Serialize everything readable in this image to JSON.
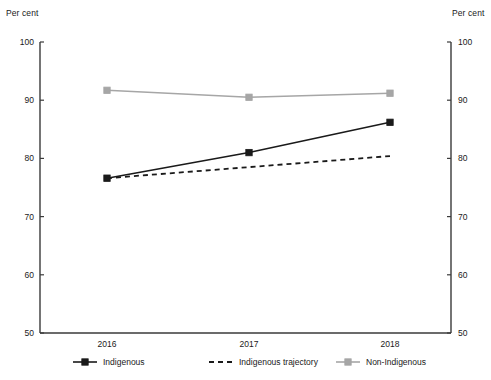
{
  "axis_caption_left": "Per cent",
  "axis_caption_right": "Per cent",
  "legend": {
    "items": [
      {
        "label": "Indigenous",
        "style": "solid-square",
        "color": "#1a1a1a"
      },
      {
        "label": "Indigenous trajectory",
        "style": "dashed",
        "color": "#1a1a1a"
      },
      {
        "label": "Non-Indigenous",
        "style": "solid-square",
        "color": "#a6a6a6"
      }
    ]
  },
  "colors": {
    "indigenous": "#1a1a1a",
    "indigenous_trajectory": "#1a1a1a",
    "non_indigenous": "#a6a6a6",
    "axis": "#3a3a3a",
    "text": "#1a1a1a"
  },
  "chart_data": {
    "type": "line",
    "title": "",
    "xlabel": "",
    "ylabel": "Per cent",
    "categories": [
      "2016",
      "2017",
      "2018"
    ],
    "x": [
      2016,
      2017,
      2018
    ],
    "ylim": [
      50,
      100
    ],
    "yticks": [
      50,
      60,
      70,
      80,
      90,
      100
    ],
    "grid": false,
    "legend_position": "bottom",
    "dual_y_axis": true,
    "series": [
      {
        "name": "Indigenous",
        "color": "#1a1a1a",
        "style": "solid",
        "marker": "square",
        "values": [
          76.6,
          81.0,
          86.2
        ]
      },
      {
        "name": "Indigenous trajectory",
        "color": "#1a1a1a",
        "style": "dashed",
        "marker": "none",
        "values": [
          76.6,
          78.5,
          80.4
        ]
      },
      {
        "name": "Non-Indigenous",
        "color": "#a6a6a6",
        "style": "solid",
        "marker": "square",
        "values": [
          91.7,
          90.5,
          91.2
        ]
      }
    ]
  }
}
